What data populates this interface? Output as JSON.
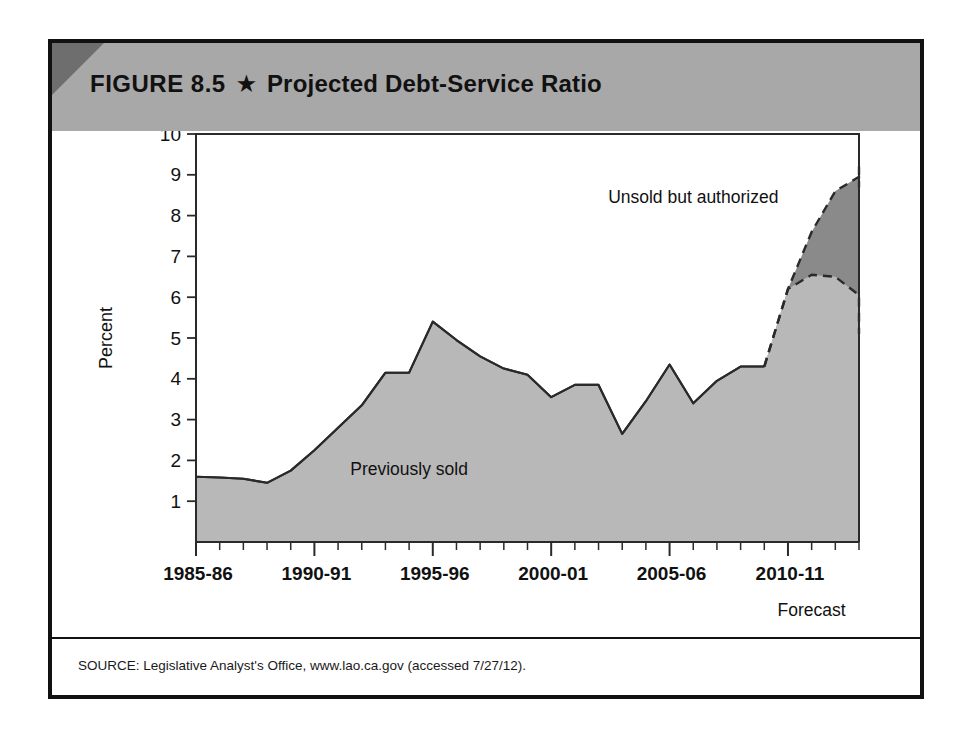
{
  "figure": {
    "number": "FIGURE 8.5",
    "star": "★",
    "title": "Projected Debt-Service Ratio",
    "source": "SOURCE: Legislative Analyst's Office, www.lao.ca.gov (accessed 7/27/12)."
  },
  "colors": {
    "banner": "#a8a8a8",
    "banner_corner": "#6e6e6e",
    "previously_sold": "#b8b8b8",
    "unsold_authorized": "#8a8a8a",
    "line": "#2a2a2a",
    "border": "#111111"
  },
  "chart_data": {
    "type": "area",
    "title": "Projected Debt-Service Ratio",
    "xlabel": "",
    "ylabel": "Percent",
    "ylim": [
      0,
      10
    ],
    "yticks": [
      1,
      2,
      3,
      4,
      5,
      6,
      7,
      8,
      9,
      10
    ],
    "grid": false,
    "legend": "inline-annotations",
    "x": [
      "1985-86",
      "1986-87",
      "1987-88",
      "1988-89",
      "1989-90",
      "1990-91",
      "1991-92",
      "1992-93",
      "1993-94",
      "1994-95",
      "1995-96",
      "1996-97",
      "1997-98",
      "1998-99",
      "1999-00",
      "2000-01",
      "2001-02",
      "2002-03",
      "2003-04",
      "2004-05",
      "2005-06",
      "2006-07",
      "2007-08",
      "2008-09",
      "2009-10",
      "2010-11",
      "2011-12",
      "2012-13",
      "2013-14"
    ],
    "xtick_labels": [
      "1985-86",
      "1990-91",
      "1995-96",
      "2000-01",
      "2005-06",
      "2010-11"
    ],
    "xtick_positions": [
      0,
      5,
      10,
      15,
      20,
      25
    ],
    "forecast_note": "Forecast",
    "forecast_starts_at": "2009-10",
    "series": [
      {
        "name": "Previously sold",
        "label": "Previously sold",
        "color": "#b8b8b8",
        "values": [
          1.6,
          1.58,
          1.55,
          1.45,
          1.75,
          2.25,
          2.8,
          3.35,
          4.15,
          4.15,
          5.4,
          4.95,
          4.55,
          4.25,
          4.1,
          3.55,
          3.85,
          3.85,
          2.65,
          3.45,
          4.35,
          3.4,
          3.95,
          4.3,
          4.3,
          6.2,
          6.55,
          6.5,
          6.05
        ],
        "tail_values": [
          5.55,
          5.1
        ]
      },
      {
        "name": "Unsold but authorized",
        "label": "Unsold but authorized",
        "color": "#8a8a8a",
        "cumulative_top": [
          1.6,
          1.58,
          1.55,
          1.45,
          1.75,
          2.25,
          2.8,
          3.35,
          4.15,
          4.15,
          5.4,
          4.95,
          4.55,
          4.25,
          4.1,
          3.55,
          3.85,
          3.85,
          2.65,
          3.45,
          4.35,
          3.4,
          3.95,
          4.3,
          4.3,
          6.2,
          7.6,
          8.6,
          8.95
        ],
        "tail_values": [
          8.7,
          9.2,
          9.1
        ]
      }
    ],
    "annotations": [
      {
        "text": "Previously sold",
        "x_index": 9,
        "y": 1.8
      },
      {
        "text": "Unsold but authorized",
        "x_index": 21,
        "y": 8.45
      },
      {
        "text": "Forecast",
        "x_index": 26,
        "y": -1.15
      }
    ]
  }
}
